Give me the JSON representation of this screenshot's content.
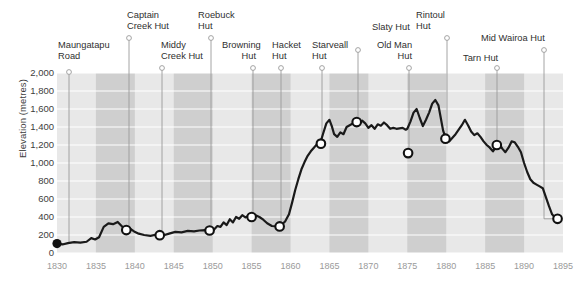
{
  "chart_data": {
    "type": "line",
    "title": "",
    "subtitle": "",
    "xlabel": "",
    "ylabel": "Elevation (metres)",
    "xlim": [
      1830,
      1895
    ],
    "ylim": [
      0,
      2000
    ],
    "grid": "horizontal-gridlines-and-alternating-vertical-bands",
    "legend": "none",
    "x_ticks": [
      "1830",
      "1835",
      "1840",
      "1845",
      "1850",
      "1855",
      "1860",
      "1865",
      "1870",
      "1875",
      "1880",
      "1885",
      "1890",
      "1895"
    ],
    "y_ticks": [
      "0",
      "200",
      "400",
      "600",
      "800",
      "1,000",
      "1,200",
      "1,400",
      "1,600",
      "1,800",
      "2,000"
    ],
    "series": [
      {
        "name": "Elevation profile",
        "points": [
          [
            1830.0,
            105
          ],
          [
            1830.7,
            95
          ],
          [
            1831.4,
            110
          ],
          [
            1832.2,
            120
          ],
          [
            1833.0,
            115
          ],
          [
            1833.8,
            125
          ],
          [
            1834.4,
            165
          ],
          [
            1834.9,
            150
          ],
          [
            1835.4,
            175
          ],
          [
            1836.0,
            290
          ],
          [
            1836.6,
            330
          ],
          [
            1837.2,
            320
          ],
          [
            1837.8,
            345
          ],
          [
            1838.3,
            300
          ],
          [
            1838.8,
            255
          ],
          [
            1839.3,
            275
          ],
          [
            1839.9,
            240
          ],
          [
            1840.5,
            215
          ],
          [
            1841.2,
            200
          ],
          [
            1842.0,
            190
          ],
          [
            1842.8,
            205
          ],
          [
            1843.6,
            195
          ],
          [
            1844.4,
            215
          ],
          [
            1845.2,
            235
          ],
          [
            1846.0,
            230
          ],
          [
            1846.8,
            245
          ],
          [
            1847.6,
            240
          ],
          [
            1848.3,
            250
          ],
          [
            1849.0,
            255
          ],
          [
            1849.6,
            250
          ],
          [
            1850.0,
            245
          ],
          [
            1850.6,
            300
          ],
          [
            1851.0,
            290
          ],
          [
            1851.4,
            340
          ],
          [
            1851.8,
            310
          ],
          [
            1852.2,
            375
          ],
          [
            1852.6,
            340
          ],
          [
            1853.0,
            400
          ],
          [
            1853.4,
            380
          ],
          [
            1853.8,
            420
          ],
          [
            1854.2,
            395
          ],
          [
            1854.6,
            415
          ],
          [
            1855.0,
            400
          ],
          [
            1855.5,
            420
          ],
          [
            1856.0,
            400
          ],
          [
            1856.5,
            370
          ],
          [
            1857.0,
            330
          ],
          [
            1857.6,
            300
          ],
          [
            1858.2,
            295
          ],
          [
            1858.8,
            310
          ],
          [
            1859.3,
            350
          ],
          [
            1859.8,
            430
          ],
          [
            1860.2,
            560
          ],
          [
            1860.6,
            700
          ],
          [
            1861.0,
            820
          ],
          [
            1861.4,
            930
          ],
          [
            1861.8,
            1010
          ],
          [
            1862.2,
            1080
          ],
          [
            1862.6,
            1130
          ],
          [
            1863.0,
            1170
          ],
          [
            1863.4,
            1210
          ],
          [
            1863.8,
            1215
          ],
          [
            1864.2,
            1330
          ],
          [
            1864.6,
            1440
          ],
          [
            1865.0,
            1480
          ],
          [
            1865.3,
            1410
          ],
          [
            1865.6,
            1320
          ],
          [
            1866.0,
            1290
          ],
          [
            1866.4,
            1340
          ],
          [
            1866.8,
            1320
          ],
          [
            1867.2,
            1400
          ],
          [
            1867.6,
            1420
          ],
          [
            1868.0,
            1440
          ],
          [
            1868.4,
            1465
          ],
          [
            1868.8,
            1430
          ],
          [
            1869.2,
            1470
          ],
          [
            1869.6,
            1440
          ],
          [
            1870.0,
            1390
          ],
          [
            1870.4,
            1420
          ],
          [
            1870.8,
            1380
          ],
          [
            1871.2,
            1430
          ],
          [
            1871.6,
            1415
          ],
          [
            1872.0,
            1450
          ],
          [
            1872.4,
            1420
          ],
          [
            1872.8,
            1380
          ],
          [
            1873.2,
            1390
          ],
          [
            1873.6,
            1380
          ],
          [
            1874.0,
            1385
          ],
          [
            1874.4,
            1390
          ],
          [
            1874.8,
            1370
          ],
          [
            1875.0,
            1380
          ],
          [
            1875.4,
            1460
          ],
          [
            1875.8,
            1560
          ],
          [
            1876.2,
            1600
          ],
          [
            1876.6,
            1500
          ],
          [
            1877.0,
            1410
          ],
          [
            1877.4,
            1480
          ],
          [
            1877.8,
            1560
          ],
          [
            1878.2,
            1660
          ],
          [
            1878.6,
            1700
          ],
          [
            1879.0,
            1640
          ],
          [
            1879.3,
            1500
          ],
          [
            1879.6,
            1360
          ],
          [
            1880.0,
            1260
          ],
          [
            1880.4,
            1240
          ],
          [
            1880.8,
            1280
          ],
          [
            1881.2,
            1320
          ],
          [
            1881.6,
            1370
          ],
          [
            1882.0,
            1420
          ],
          [
            1882.4,
            1480
          ],
          [
            1882.8,
            1420
          ],
          [
            1883.2,
            1350
          ],
          [
            1883.6,
            1310
          ],
          [
            1884.0,
            1330
          ],
          [
            1884.4,
            1290
          ],
          [
            1884.8,
            1240
          ],
          [
            1885.2,
            1200
          ],
          [
            1885.6,
            1170
          ],
          [
            1886.0,
            1130
          ],
          [
            1886.4,
            1180
          ],
          [
            1886.8,
            1215
          ],
          [
            1887.2,
            1160
          ],
          [
            1887.6,
            1120
          ],
          [
            1888.0,
            1170
          ],
          [
            1888.4,
            1240
          ],
          [
            1888.8,
            1230
          ],
          [
            1889.2,
            1180
          ],
          [
            1889.6,
            1120
          ],
          [
            1890.0,
            1000
          ],
          [
            1890.4,
            900
          ],
          [
            1890.8,
            820
          ],
          [
            1891.2,
            780
          ],
          [
            1891.6,
            760
          ],
          [
            1892.0,
            740
          ],
          [
            1892.4,
            720
          ],
          [
            1892.8,
            620
          ],
          [
            1893.2,
            520
          ],
          [
            1893.6,
            430
          ],
          [
            1894.0,
            390
          ],
          [
            1894.3,
            380
          ]
        ]
      }
    ],
    "markers": [
      {
        "name": "Maungatapu Road",
        "x": 1830.0,
        "y": 105,
        "style": "filled",
        "label_lines": [
          "Maungatapu",
          "Road"
        ],
        "label_x": 58,
        "label_y": 40,
        "align": "left",
        "tick_x": 69,
        "tick_y": 72
      },
      {
        "name": "Captain Creek Hut",
        "x": 1838.9,
        "y": 255,
        "style": "open",
        "label_lines": [
          "Captain",
          "Creek Hut"
        ],
        "label_x": 127,
        "label_y": 10,
        "align": "left",
        "tick_x": 129,
        "tick_y": 38
      },
      {
        "name": "Middy Creek Hut",
        "x": 1843.2,
        "y": 198,
        "style": "open",
        "label_lines": [
          "Middy",
          "Creek Hut"
        ],
        "label_x": 161,
        "label_y": 40,
        "align": "left",
        "tick_x": 162,
        "tick_y": 68
      },
      {
        "name": "Roebuck Hut",
        "x": 1849.6,
        "y": 250,
        "style": "open",
        "label_lines": [
          "Roebuck",
          "Hut"
        ],
        "label_x": 198,
        "label_y": 10,
        "align": "left",
        "tick_x": 211,
        "tick_y": 38
      },
      {
        "name": "Browning Hut",
        "x": 1855.0,
        "y": 400,
        "style": "open",
        "label_lines": [
          "Browning",
          "Hut"
        ],
        "label_x": 222,
        "label_y": 40,
        "align": "right",
        "tick_x": 253,
        "tick_y": 68
      },
      {
        "name": "Hacket Hut",
        "x": 1858.6,
        "y": 295,
        "style": "open",
        "label_lines": [
          "Hacket",
          "Hut"
        ],
        "label_x": 272,
        "label_y": 40,
        "align": "left",
        "tick_x": 281,
        "tick_y": 68
      },
      {
        "name": "Starveall Hut",
        "x": 1863.9,
        "y": 1215,
        "style": "open",
        "label_lines": [
          "Starveall",
          "Hut"
        ],
        "label_x": 312,
        "label_y": 40,
        "align": "left",
        "tick_x": 322,
        "tick_y": 68
      },
      {
        "name": "Slaty Hut",
        "x": 1868.5,
        "y": 1455,
        "style": "open",
        "label_lines": [
          "Slaty Hut"
        ],
        "label_x": 372,
        "label_y": 22,
        "align": "left",
        "tick_x": 358,
        "tick_y": 50
      },
      {
        "name": "Old Man Hut",
        "x": 1875.1,
        "y": 1110,
        "style": "open",
        "label_lines": [
          "Old Man",
          "Hut"
        ],
        "label_x": 377,
        "label_y": 40,
        "align": "right",
        "tick_x": 409,
        "tick_y": 68
      },
      {
        "name": "Rintoul Hut",
        "x": 1879.9,
        "y": 1270,
        "style": "open",
        "label_lines": [
          "Rintoul",
          "Hut"
        ],
        "label_x": 416,
        "label_y": 10,
        "align": "left",
        "tick_x": 447,
        "tick_y": 38
      },
      {
        "name": "Tarn Hut",
        "x": 1886.5,
        "y": 1200,
        "style": "open",
        "label_lines": [
          "Tarn Hut"
        ],
        "label_x": 463,
        "label_y": 53,
        "align": "left",
        "tick_x": 497,
        "tick_y": 68
      },
      {
        "name": "Mid Wairoa Hut",
        "x": 1894.3,
        "y": 380,
        "style": "open",
        "label_lines": [
          "Mid Wairoa Hut"
        ],
        "label_x": 481,
        "label_y": 33,
        "align": "left",
        "tick_x": 544,
        "tick_y": 50
      }
    ],
    "band_years": [
      1835,
      1840,
      1845,
      1850,
      1855,
      1860,
      1865,
      1870,
      1875,
      1880,
      1885,
      1890
    ],
    "colors": {
      "line": "#1a1a1a",
      "marker_fill": "#ffffff",
      "marker_filled": "#111111",
      "band_dark": "#cfcfcf",
      "band_light": "#e8e8e8",
      "gridline": "#ffffff",
      "leader_line": "#9a9a9a",
      "tick_text": "#9a9a9a",
      "label_text": "#2f2f2f"
    }
  }
}
